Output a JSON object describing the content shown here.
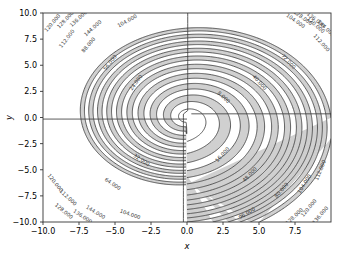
{
  "figure": {
    "background_color": "#ffffff",
    "plot_background_color": "#ffffff",
    "fill_color": "#cdcdcd",
    "line_color": "#3f3f3f",
    "spine_color": "#333333",
    "label_color": "#000000"
  },
  "chart_data": {
    "type": "contour",
    "title": "",
    "xlabel": "x",
    "ylabel": "y",
    "xlim": [
      -10.0,
      10.0
    ],
    "ylim": [
      -10.0,
      10.0
    ],
    "xticks": [
      -10.0,
      -7.5,
      -5.0,
      -2.5,
      0.0,
      2.5,
      5.0,
      7.5
    ],
    "xtick_labels": [
      "-10.0",
      "-7.5",
      "-5.0",
      "-2.5",
      "0.0",
      "2.5",
      "5.0",
      "7.5"
    ],
    "yticks": [
      -10.0,
      -7.5,
      -5.0,
      -2.5,
      0.0,
      2.5,
      5.0,
      7.5,
      10.0
    ],
    "ytick_labels": [
      "-10.0",
      "-7.5",
      "-5.0",
      "-2.5",
      "0.0",
      "2.5",
      "5.0",
      "7.5",
      "10.0"
    ],
    "grid": false,
    "legend": false,
    "level_step": 8,
    "level_min": 8,
    "level_max": 152,
    "levels": [
      8,
      16,
      24,
      32,
      40,
      48,
      56,
      64,
      72,
      80,
      88,
      96,
      104,
      112,
      120,
      128,
      136,
      144,
      152
    ],
    "label_format": "%.3f",
    "labeled_levels": [
      "8.000",
      "16.000",
      "24.000",
      "32.000",
      "40.000",
      "48.000",
      "56.000",
      "64.000",
      "72.000",
      "80.000",
      "88.000",
      "96.000",
      "104.000",
      "112.000",
      "120.000",
      "128.000",
      "136.000",
      "144.000"
    ],
    "fill_alternating": true,
    "fill_bands_start_index": 1,
    "field": "spiral: r^2 + k*r*theta_wrapped, pinwheel branch cut",
    "annotations": [
      {
        "text": "8.000",
        "x": 2.55,
        "y": 1.95
      },
      {
        "text": "16.000",
        "x": 2.45,
        "y": -3.55
      },
      {
        "text": "24.000",
        "x": -3.55,
        "y": 3.35
      },
      {
        "text": "32.000",
        "x": -3.15,
        "y": -4.05
      },
      {
        "text": "40.000",
        "x": 5.05,
        "y": 3.35
      },
      {
        "text": "48.000",
        "x": 4.35,
        "y": -5.45
      },
      {
        "text": "56.000",
        "x": -5.35,
        "y": 5.25
      },
      {
        "text": "64.000",
        "x": -5.15,
        "y": -6.35
      },
      {
        "text": "72.000",
        "x": 7.05,
        "y": 5.35
      },
      {
        "text": "80.000",
        "x": 6.55,
        "y": -6.95
      },
      {
        "text": "88.000",
        "x": -6.85,
        "y": 6.95
      },
      {
        "text": "96.000",
        "x": 4.15,
        "y": -9.15
      },
      {
        "text": "104.000",
        "x": -4.15,
        "y": 9.25
      },
      {
        "text": "104.000",
        "x": 8.15,
        "y": -6.35
      },
      {
        "text": "104.000",
        "x": -3.95,
        "y": -9.25
      },
      {
        "text": "104.000",
        "x": 7.55,
        "y": 9.25
      },
      {
        "text": "112.000",
        "x": -8.35,
        "y": 7.55
      },
      {
        "text": "112.000",
        "x": 9.25,
        "y": -5.05
      },
      {
        "text": "112.000",
        "x": -8.25,
        "y": -7.65
      },
      {
        "text": "112.000",
        "x": 9.35,
        "y": 7.15
      },
      {
        "text": "120.000",
        "x": -9.35,
        "y": 9.05
      },
      {
        "text": "120.000",
        "x": -9.15,
        "y": -6.25
      },
      {
        "text": "120.000",
        "x": 8.45,
        "y": -8.65
      },
      {
        "text": "120.000",
        "x": 8.95,
        "y": 8.85
      },
      {
        "text": "128.000",
        "x": -8.45,
        "y": 9.35
      },
      {
        "text": "128.000",
        "x": 7.45,
        "y": -9.45
      },
      {
        "text": "128.000",
        "x": -8.55,
        "y": -8.95
      },
      {
        "text": "128.000",
        "x": 8.05,
        "y": 9.55
      },
      {
        "text": "136.000",
        "x": -7.55,
        "y": 9.45
      },
      {
        "text": "136.000",
        "x": 9.25,
        "y": -9.35
      },
      {
        "text": "136.000",
        "x": -7.25,
        "y": -9.45
      },
      {
        "text": "136.000",
        "x": 8.95,
        "y": 9.35
      },
      {
        "text": "144.000",
        "x": -6.55,
        "y": 8.55
      },
      {
        "text": "144.000",
        "x": -6.35,
        "y": -9.05
      },
      {
        "text": "144.000",
        "x": 9.65,
        "y": 8.55
      }
    ]
  }
}
